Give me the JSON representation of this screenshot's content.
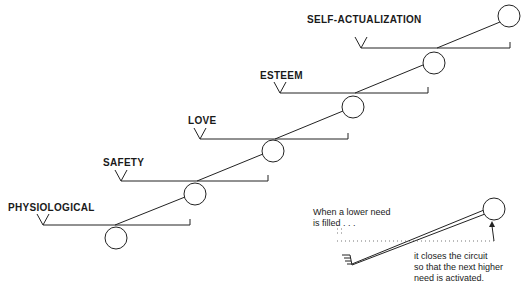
{
  "diagram": {
    "title": "",
    "levels": [
      {
        "label": "PHYSIOLOGICAL"
      },
      {
        "label": "SAFETY"
      },
      {
        "label": "LOVE"
      },
      {
        "label": "ESTEEM"
      },
      {
        "label": "SELF-ACTUALIZATION"
      }
    ],
    "inset": {
      "note_top_line1": "When a lower need",
      "note_top_line2": "is filled . . .",
      "note_bottom_line1": "it closes the circuit",
      "note_bottom_line2": "so that the next higher",
      "note_bottom_line3": "need is activated."
    },
    "colors": {
      "line": "#222222",
      "background": "#ffffff"
    }
  }
}
